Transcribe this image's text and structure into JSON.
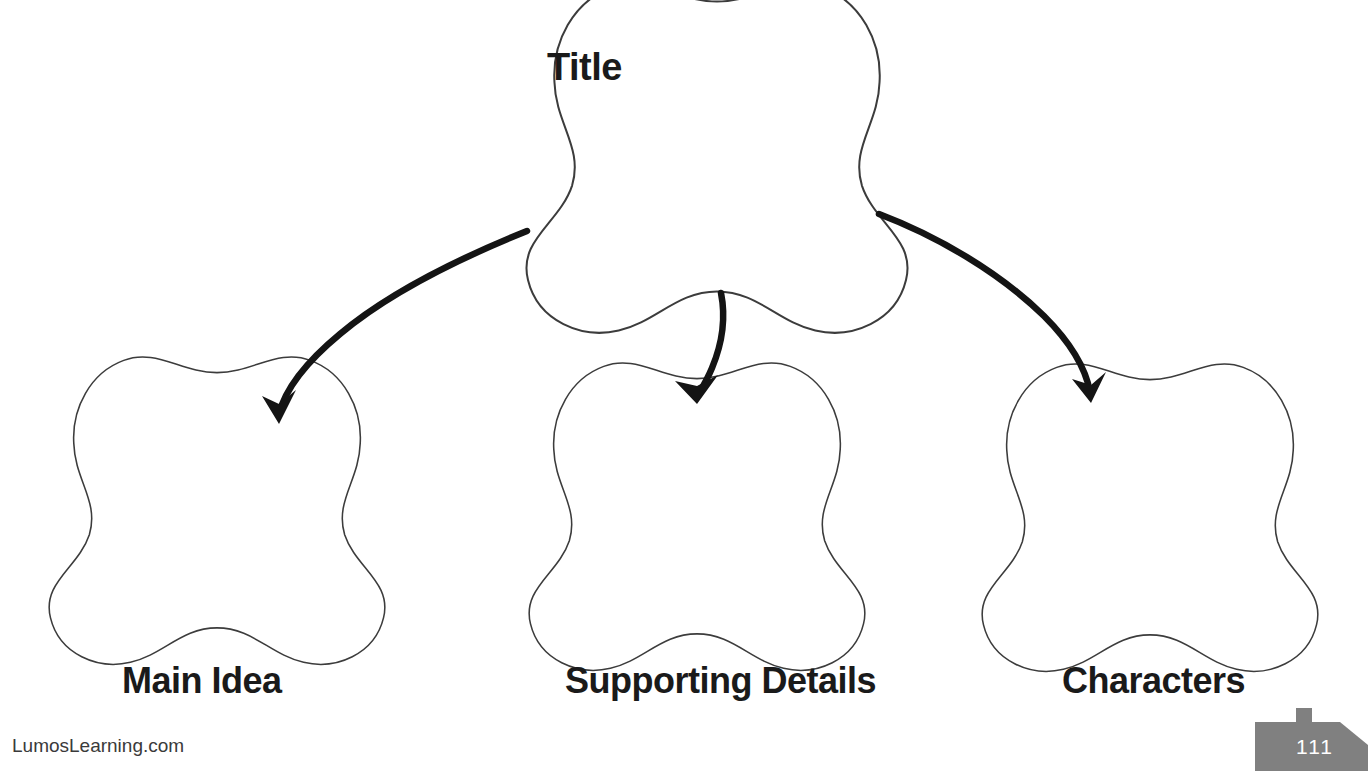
{
  "worksheet": {
    "type": "story-map-graphic-organizer",
    "background_color": "#ffffff",
    "ink_color": "#1a1a1a",
    "outline_color": "#3c3c3c"
  },
  "nodes": {
    "title": {
      "label": "Title",
      "shape": "five-lobe-cloud",
      "center_x": 717,
      "center_y": 178,
      "radius": 133
    },
    "main_idea": {
      "label": "Main Idea",
      "shape": "five-lobe-cloud",
      "center_x": 217,
      "center_y": 528,
      "radius": 128
    },
    "supporting_details": {
      "label": "Supporting Details",
      "shape": "five-lobe-cloud",
      "center_x": 697,
      "center_y": 534,
      "radius": 128
    },
    "characters": {
      "label": "Characters",
      "shape": "five-lobe-cloud",
      "center_x": 1150,
      "center_y": 535,
      "radius": 128
    }
  },
  "connectors": [
    {
      "name": "title-to-main-idea",
      "from": "title",
      "to": "main_idea",
      "style": "hand-drawn-curved-arrow",
      "start_x": 527,
      "start_y": 231,
      "end_x": 278,
      "end_y": 420
    },
    {
      "name": "title-to-supporting-details",
      "from": "title",
      "to": "supporting_details",
      "style": "hand-drawn-curved-arrow",
      "start_x": 721,
      "start_y": 294,
      "end_x": 698,
      "end_y": 398
    },
    {
      "name": "title-to-characters",
      "from": "title",
      "to": "characters",
      "style": "hand-drawn-curved-arrow",
      "start_x": 879,
      "start_y": 214,
      "end_x": 1091,
      "end_y": 398
    }
  ],
  "footer": {
    "url": "LumosLearning.com",
    "page_number": "111",
    "badge_color": "#808080",
    "badge_text_color": "#ffffff"
  }
}
